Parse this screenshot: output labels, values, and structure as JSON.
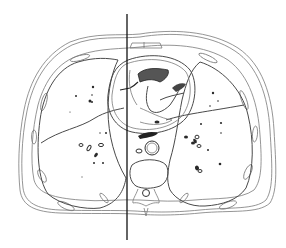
{
  "figure": {
    "background_color": "#ffffff",
    "line_color": "#222222",
    "structures": [
      {
        "name": "body-wall-outer-contour"
      },
      {
        "name": "body-wall-inner-contour"
      },
      {
        "name": "ribs",
        "count": 10
      },
      {
        "name": "sternum"
      },
      {
        "name": "right-lung"
      },
      {
        "name": "left-lung"
      },
      {
        "name": "right-lung-fissure"
      },
      {
        "name": "left-lung-fissure"
      },
      {
        "name": "heart-pericardium"
      },
      {
        "name": "heart-chambers-valves"
      },
      {
        "name": "esophagus"
      },
      {
        "name": "descending-aorta"
      },
      {
        "name": "azygos-vein"
      },
      {
        "name": "vertebral-body"
      },
      {
        "name": "spinal-canal"
      },
      {
        "name": "spinous-process"
      },
      {
        "name": "pulmonary-vessels"
      }
    ],
    "reference_line": {
      "orientation": "vertical",
      "x": 127,
      "y_start": 14,
      "y_end": 240,
      "color": "#111111"
    }
  }
}
